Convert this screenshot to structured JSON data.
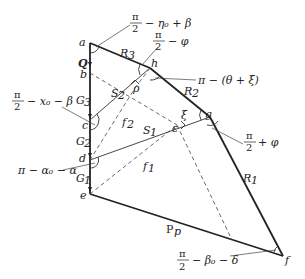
{
  "diagram": {
    "type": "mechanics/geometry free-body polygon",
    "points": {
      "a": "a",
      "b": "b",
      "c": "c",
      "d": "d",
      "e": "e",
      "f": "f",
      "g": "g",
      "h": "h"
    },
    "forces": {
      "Q": "Q",
      "G1": "G",
      "G1_sub": "1",
      "G2": "G",
      "G2_sub": "2",
      "G3": "G",
      "G3_sub": "3",
      "R1": "R",
      "R1_sub": "1",
      "R2": "R",
      "R2_sub": "2",
      "R3": "R",
      "R3_sub": "3",
      "S1": "S",
      "S1_sub": "1",
      "S2": "S",
      "S2_sub": "2",
      "Pp": "P",
      "Pp_sub": "p",
      "f1": "f",
      "f1_sub": "1",
      "f2": "f",
      "f2_sub": "2"
    },
    "angles_inline": {
      "rho": "ρ",
      "epsilon": "ε",
      "xi": "ξ"
    },
    "angle_labels": {
      "top": {
        "num": "π",
        "den": "2",
        "rest": "− η₀ + β"
      },
      "phi_top": {
        "num": "π",
        "den": "2",
        "rest": "− φ"
      },
      "pi_theta_xi": {
        "text": "π − (θ + ξ)"
      },
      "phi_right": {
        "num": "π",
        "den": "2",
        "rest": "+ φ"
      },
      "left_G3": {
        "num": "π",
        "den": "2",
        "rest": "− x₀ − β"
      },
      "left_d": {
        "text": "π − α₀ − α"
      },
      "bottom_f": {
        "num": "π",
        "den": "2",
        "rest": "− β₀ − δ"
      }
    }
  }
}
